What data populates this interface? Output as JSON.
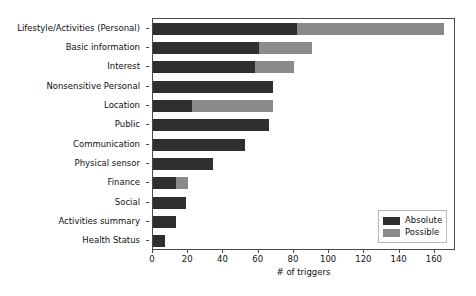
{
  "chart_data": {
    "type": "bar",
    "orientation": "horizontal",
    "stacked": true,
    "title": "",
    "xlabel": "# of triggers",
    "ylabel": "",
    "xlim": [
      0,
      172
    ],
    "xticks": [
      0,
      20,
      40,
      60,
      80,
      100,
      120,
      140,
      160
    ],
    "xticklabels": [
      "0",
      "20",
      "40",
      "60",
      "80",
      "100",
      "120",
      "140",
      "160"
    ],
    "grid": false,
    "categories": [
      "Lifestyle/Activities (Personal)",
      "Basic information",
      "Interest",
      "Nonsensitive Personal",
      "Location",
      "Public",
      "Communication",
      "Physical sensor",
      "Finance",
      "Social",
      "Activities summary",
      "Health Status"
    ],
    "series": [
      {
        "name": "Absolute",
        "color": "#2f2f2f",
        "values": [
          82,
          60,
          58,
          68,
          22,
          66,
          52,
          34,
          13,
          19,
          13,
          7
        ]
      },
      {
        "name": "Possible",
        "color": "#8a8a8a",
        "values": [
          83,
          30,
          22,
          0,
          46,
          0,
          0,
          0,
          7,
          0,
          0,
          0
        ]
      }
    ],
    "totals": [
      165,
      90,
      80,
      68,
      68,
      66,
      52,
      34,
      20,
      19,
      13,
      7
    ],
    "legend": {
      "position": "lower right",
      "entries": [
        {
          "label": "Absolute",
          "color": "#2f2f2f"
        },
        {
          "label": "Possible",
          "color": "#8a8a8a"
        }
      ]
    }
  }
}
